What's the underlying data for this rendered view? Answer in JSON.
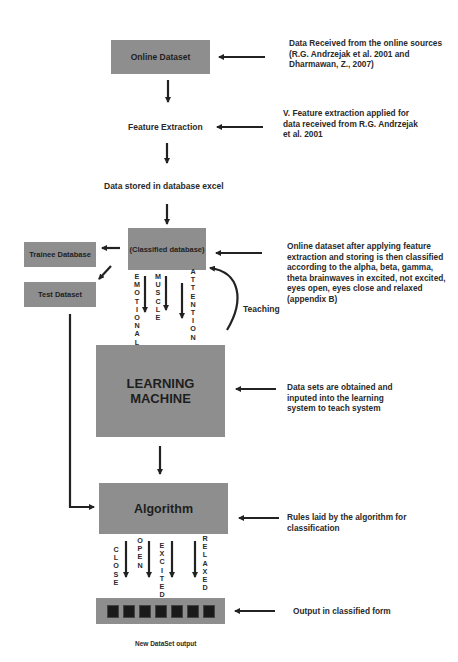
{
  "diagram": {
    "nodes": {
      "online_dataset": "Online Dataset",
      "feature_extraction": "Feature Extraction",
      "data_stored": "Data stored in database excel",
      "classified_database": "(Classified database)",
      "trainee_database": "Trainee Database",
      "test_dataset": "Test Dataset",
      "learning_machine": "LEARNING MACHINE",
      "algorithm": "Algorithm",
      "new_dataset_output": "New DataSet output"
    },
    "edge_labels": {
      "teaching": "Teaching",
      "emotional": "EMOTIONAL",
      "muscle": "MUSCLE",
      "attention": "ATTENTION",
      "close": "CLOSE",
      "open": "OPEN",
      "excited": "EXCITED",
      "relaxed": "RELAXED"
    },
    "annotations": {
      "online_dataset": "Data Received from the online sources (R.G. Andrzejak et al. 2001 and Dharmawan, Z., 2007)",
      "feature_extraction": "V. Feature extraction applied for data received from R.G. Andrzejak et al. 2001",
      "classified_database": "Online dataset after applying feature extraction and storing is then classified according to the alpha, beta, gamma, theta brainwaves in excited, not excited, eyes open, eyes close and relaxed (appendix B)",
      "learning_machine": "Data sets are obtained and inputed into the learning system to teach system",
      "algorithm": "Rules laid by the algorithm for classification",
      "output": "Output in classified form"
    },
    "output_cells": 7,
    "colors": {
      "box_fill": "#8e8e8e",
      "arrow": "#222222",
      "output_cell": "#1a1a1a"
    }
  }
}
